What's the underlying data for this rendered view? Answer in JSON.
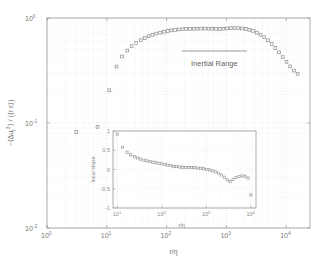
{
  "figure": {
    "name": "third-order-structure-function-loglog",
    "background": "#ffffff",
    "frame_color": "#9a9a9a",
    "grid_color": "#d8d8d8",
    "marker_color": "#8c8c8c"
  },
  "main_axes": {
    "xlabel": "r/η",
    "ylabel_parts": {
      "minus": "−⟨Δu",
      "sub": "r",
      "sup": "3",
      "close": "⟩ / (⟨r ε⟩)"
    },
    "ylabel_plain": "−⟨Δuᵣ³⟩ / (⟨r ε⟩)",
    "xticks": [
      {
        "label": "10",
        "exp": "0",
        "value": 1
      },
      {
        "label": "10",
        "exp": "1",
        "value": 10
      },
      {
        "label": "10",
        "exp": "2",
        "value": 100
      },
      {
        "label": "10",
        "exp": "3",
        "value": 1000
      },
      {
        "label": "10",
        "exp": "4",
        "value": 10000
      }
    ],
    "yticks": [
      {
        "label": "10",
        "exp": "0",
        "value": 1
      },
      {
        "label": "10",
        "exp": "-1",
        "value": 0.1
      },
      {
        "label": "10",
        "exp": "-2",
        "value": 0.01
      }
    ],
    "xlim": [
      1,
      25000
    ],
    "ylim": [
      0.01,
      1.0
    ],
    "xscale": "log",
    "yscale": "log"
  },
  "annotation": {
    "label": "Inertial Range",
    "bar_x_start": 180,
    "bar_x_end": 2200
  },
  "inset_axes": {
    "xlabel": "r/η",
    "ylabel": "local slope",
    "xticks": [
      {
        "label": "10",
        "exp": "1",
        "value": 10
      },
      {
        "label": "10",
        "exp": "2",
        "value": 100
      },
      {
        "label": "10",
        "exp": "3",
        "value": 1000
      },
      {
        "label": "10",
        "exp": "4",
        "value": 10000
      }
    ],
    "yticks": [
      {
        "label": "1",
        "value": 1
      },
      {
        "label": "0.5",
        "value": 0.5
      },
      {
        "label": "0",
        "value": 0
      },
      {
        "label": "-0.5",
        "value": -0.5
      },
      {
        "label": "-1",
        "value": -1
      }
    ],
    "xlim": [
      8,
      13000
    ],
    "ylim": [
      -1,
      1
    ],
    "xscale": "log",
    "yscale": "linear"
  },
  "chart_data": [
    {
      "type": "scatter",
      "name": "main-structure-function",
      "title": "",
      "xlabel": "r/η",
      "ylabel": "−⟨Δuᵣ³⟩ / (⟨r ε⟩)",
      "xscale": "log",
      "yscale": "log",
      "xlim": [
        1,
        25000
      ],
      "ylim": [
        0.01,
        1.0
      ],
      "grid": true,
      "legend": null,
      "marker": "square",
      "x": [
        3.1,
        7.0,
        11.0,
        14.5,
        18.0,
        22.0,
        26.0,
        31.0,
        37.0,
        43.0,
        50.0,
        58.0,
        67.0,
        78.0,
        90.0,
        104.0,
        120.0,
        139.0,
        160.0,
        185.0,
        213.0,
        246.0,
        284.0,
        327.0,
        378.0,
        436.0,
        503.0,
        580.0,
        669.0,
        772.0,
        890.0,
        1027.0,
        1185.0,
        1367.0,
        1577.0,
        1819.0,
        2099.0,
        2421.0,
        2793.0,
        3222.0,
        3717.0,
        4288.0,
        4947.0,
        5707.0,
        6584.0,
        7596.0,
        8763.0,
        10110.0,
        11664.0,
        13455.0,
        15522.0
      ],
      "y": [
        0.082,
        0.092,
        0.205,
        0.345,
        0.43,
        0.49,
        0.54,
        0.58,
        0.615,
        0.645,
        0.67,
        0.69,
        0.71,
        0.725,
        0.74,
        0.752,
        0.762,
        0.77,
        0.777,
        0.782,
        0.786,
        0.789,
        0.791,
        0.792,
        0.793,
        0.793,
        0.792,
        0.791,
        0.789,
        0.787,
        0.79,
        0.796,
        0.8,
        0.802,
        0.8,
        0.795,
        0.786,
        0.772,
        0.752,
        0.726,
        0.694,
        0.656,
        0.612,
        0.566,
        0.518,
        0.47,
        0.424,
        0.382,
        0.346,
        0.316,
        0.295
      ]
    },
    {
      "type": "scatter",
      "name": "inset-local-slope",
      "title": "",
      "xlabel": "r/η",
      "ylabel": "local slope",
      "xscale": "log",
      "yscale": "linear",
      "xlim": [
        8,
        13000
      ],
      "ylim": [
        -1,
        1
      ],
      "grid": true,
      "legend": null,
      "marker": "square",
      "x": [
        10.0,
        13.0,
        16.5,
        20.0,
        24.0,
        28.5,
        33.5,
        39.5,
        46.0,
        54.0,
        63.0,
        73.5,
        86.0,
        100.0,
        117.0,
        136.0,
        159.0,
        185.0,
        216.0,
        252.0,
        294.0,
        343.0,
        400.0,
        466.0,
        543.0,
        633.0,
        738.0,
        860.0,
        1003.0,
        1169.0,
        1363.0,
        1589.0,
        1852.0,
        2159.0,
        2516.0,
        2933.0,
        3419.0,
        3985.0,
        4645.0,
        5414.0,
        6310.0,
        7355.0,
        8573.0,
        9993.0
      ],
      "y": [
        0.92,
        0.58,
        0.45,
        0.38,
        0.33,
        0.3,
        0.27,
        0.245,
        0.225,
        0.205,
        0.19,
        0.175,
        0.16,
        0.145,
        0.13,
        0.115,
        0.1,
        0.085,
        0.075,
        0.065,
        0.06,
        0.055,
        0.055,
        0.05,
        0.045,
        0.04,
        0.03,
        0.02,
        0.005,
        -0.01,
        -0.035,
        -0.06,
        -0.095,
        -0.14,
        -0.2,
        -0.27,
        -0.31,
        -0.255,
        -0.21,
        -0.18,
        -0.165,
        -0.175,
        -0.22,
        -0.66
      ]
    }
  ]
}
